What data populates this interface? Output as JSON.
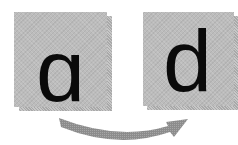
{
  "diagram": {
    "source_tile": {
      "glyph": "ɑ",
      "fill": "#bcbcbc",
      "shadow": "#a9a9a9"
    },
    "target_tile": {
      "glyph": "d",
      "fill": "#bcbcbc",
      "shadow": "#a9a9a9"
    },
    "arrow": {
      "direction": "left-to-right",
      "shape": "curved-down",
      "color": "#8f8f8f"
    }
  }
}
